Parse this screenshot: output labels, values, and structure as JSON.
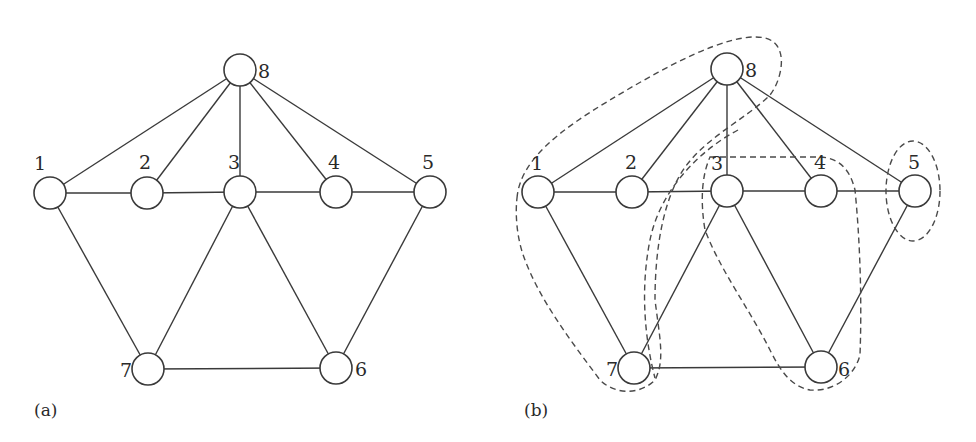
{
  "panels": [
    {
      "id": "a",
      "caption": "(a)",
      "caption_pos": [
        34,
        416
      ],
      "nodes": [
        {
          "id": "1",
          "label": "1",
          "x": 50,
          "y": 193,
          "lx": 34,
          "ly": 170
        },
        {
          "id": "2",
          "label": "2",
          "x": 147,
          "y": 193,
          "lx": 139,
          "ly": 169
        },
        {
          "id": "3",
          "label": "3",
          "x": 240,
          "y": 192,
          "lx": 228,
          "ly": 169
        },
        {
          "id": "4",
          "label": "4",
          "x": 336,
          "y": 192,
          "lx": 328,
          "ly": 169
        },
        {
          "id": "5",
          "label": "5",
          "x": 430,
          "y": 192,
          "lx": 422,
          "ly": 169
        },
        {
          "id": "6",
          "label": "6",
          "x": 336,
          "y": 368,
          "lx": 355,
          "ly": 376
        },
        {
          "id": "7",
          "label": "7",
          "x": 148,
          "y": 369,
          "lx": 120,
          "ly": 377
        },
        {
          "id": "8",
          "label": "8",
          "x": 240,
          "y": 70,
          "lx": 258,
          "ly": 78
        }
      ]
    },
    {
      "id": "b",
      "caption": "(b)",
      "caption_pos": [
        524,
        416
      ],
      "nodes": [
        {
          "id": "1",
          "label": "1",
          "x": 538,
          "y": 192,
          "lx": 531,
          "ly": 170
        },
        {
          "id": "2",
          "label": "2",
          "x": 632,
          "y": 192,
          "lx": 625,
          "ly": 169
        },
        {
          "id": "3",
          "label": "3",
          "x": 727,
          "y": 191,
          "lx": 711,
          "ly": 170
        },
        {
          "id": "4",
          "label": "4",
          "x": 821,
          "y": 191,
          "lx": 814,
          "ly": 169
        },
        {
          "id": "5",
          "label": "5",
          "x": 915,
          "y": 191,
          "lx": 908,
          "ly": 169
        },
        {
          "id": "6",
          "label": "6",
          "x": 821,
          "y": 367,
          "lx": 838,
          "ly": 376
        },
        {
          "id": "7",
          "label": "7",
          "x": 634,
          "y": 368,
          "lx": 606,
          "ly": 376
        },
        {
          "id": "8",
          "label": "8",
          "x": 727,
          "y": 69,
          "lx": 745,
          "ly": 77
        }
      ],
      "clusters": [
        {
          "name": "cluster-1-2-7-8",
          "members": [
            "1",
            "2",
            "7",
            "8"
          ]
        },
        {
          "name": "cluster-3-7",
          "members": [
            "3",
            "7"
          ]
        },
        {
          "name": "cluster-3-4-6",
          "members": [
            "3",
            "4",
            "6"
          ]
        },
        {
          "name": "cluster-5",
          "members": [
            "5"
          ]
        }
      ]
    }
  ],
  "edges": [
    [
      "8",
      "1"
    ],
    [
      "8",
      "2"
    ],
    [
      "8",
      "3"
    ],
    [
      "8",
      "4"
    ],
    [
      "8",
      "5"
    ],
    [
      "1",
      "2"
    ],
    [
      "2",
      "3"
    ],
    [
      "3",
      "4"
    ],
    [
      "4",
      "5"
    ],
    [
      "1",
      "7"
    ],
    [
      "3",
      "7"
    ],
    [
      "3",
      "6"
    ],
    [
      "5",
      "6"
    ],
    [
      "7",
      "6"
    ]
  ],
  "node_radius": 16
}
